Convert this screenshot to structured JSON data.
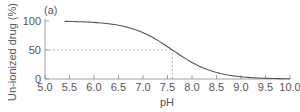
{
  "chart_data": {
    "type": "line",
    "title": "",
    "panel_label": "(a)",
    "xlabel": "pH",
    "ylabel": "Un-ionized drug (%)",
    "xlim": [
      5.0,
      10.0
    ],
    "ylim": [
      0,
      100
    ],
    "x_ticks": [
      "5.0",
      "5.5",
      "6.0",
      "6.5",
      "7.0",
      "7.5",
      "8.0",
      "8.5",
      "9.0",
      "9.5",
      "10.0"
    ],
    "y_ticks": [
      "0",
      "50",
      "100"
    ],
    "grid": false,
    "legend": null,
    "series": [
      {
        "name": "Un-ionized drug",
        "pKa": 7.6,
        "x": [
          5.4,
          5.5,
          6.0,
          6.5,
          7.0,
          7.5,
          7.6,
          8.0,
          8.5,
          9.0,
          9.5,
          10.0
        ],
        "values": [
          99.4,
          99.2,
          97.5,
          92.6,
          79.9,
          55.7,
          50.0,
          28.5,
          11.2,
          3.8,
          1.2,
          0.4
        ]
      }
    ],
    "annotations": [
      {
        "type": "dashed-line",
        "description": "horizontal guide at 50%",
        "y": 50,
        "x_range": [
          5.0,
          7.6
        ]
      },
      {
        "type": "dashed-line",
        "description": "vertical guide at pH 7.6 (pKa)",
        "x": 7.6,
        "y_range": [
          0,
          50
        ]
      }
    ],
    "colors": {
      "curve": "#555555",
      "axis": "#888888",
      "guide": "#999999",
      "text": "#555555"
    }
  }
}
